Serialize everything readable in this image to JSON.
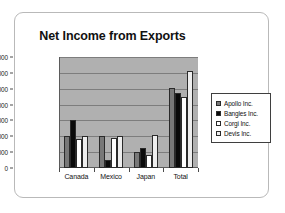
{
  "chart_data": {
    "type": "bar",
    "title": "Net Income from Exports",
    "xlabel": "",
    "ylabel": "",
    "ylim": [
      0,
      7000000
    ],
    "ytick_step": 1000000,
    "grid": true,
    "legend_position": "right",
    "categories": [
      "Canada",
      "Mexico",
      "Japan",
      "Total"
    ],
    "ytick_labels": [
      "7,000,000",
      "6,000,000",
      "5,000,000",
      "4,000,000",
      "3,000,000",
      "2,000,000",
      "1,000,000",
      "0"
    ],
    "ytick_values": [
      7000000,
      6000000,
      5000000,
      4000000,
      3000000,
      2000000,
      1000000,
      0
    ],
    "series": [
      {
        "name": "Apollo Inc.",
        "color": "#787878",
        "values": [
          2000000,
          2000000,
          1000000,
          5050000
        ]
      },
      {
        "name": "Bangles Inc.",
        "color": "#0a0a0a",
        "values": [
          3000000,
          500000,
          1250000,
          4750000
        ]
      },
      {
        "name": "Corgi Inc.",
        "color": "#ffffff",
        "values": [
          1800000,
          1900000,
          800000,
          4500000
        ]
      },
      {
        "name": "Devis Inc.",
        "color": "#eeeeee",
        "values": [
          2000000,
          2050000,
          2100000,
          6100000
        ]
      }
    ],
    "plot_background": "#b0b0b0",
    "legend_border": "#3f3f3f"
  }
}
